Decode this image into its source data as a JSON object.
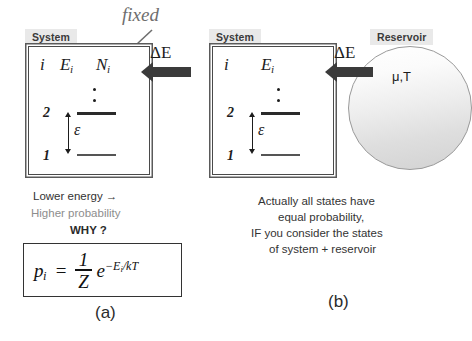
{
  "figure": {
    "width": 472,
    "height": 341,
    "background": "#ffffff"
  },
  "colors": {
    "ink": "#1d1d1d",
    "label_bg": "#e9e9e9",
    "label_text": "#3a3a3a",
    "arrow_fill": "#3b3b3b",
    "dim_text": "#8d8d8d",
    "fixed_text": "#6e6e6e",
    "box_border": "#4a4a4a",
    "reservoir_border": "#9a9a9a"
  },
  "panel_a": {
    "subfigure_label": "(a)",
    "system_label": "System",
    "annotation": {
      "text": "fixed",
      "points_to": "N_i"
    },
    "energy_flow": {
      "label": "ΔE",
      "direction": "into-system",
      "arrow_icon": "left-block-arrow-icon"
    },
    "columns": {
      "index": "i",
      "energy_base": "E",
      "energy_sub": "i",
      "number_base": "N",
      "number_sub": "i"
    },
    "levels": [
      {
        "name": "2",
        "kind": "thick"
      },
      {
        "name": "1",
        "kind": "thin"
      }
    ],
    "ellipsis_dots": 2,
    "gap_symbol": "ε",
    "caption_lines": [
      {
        "text": "Lower energy →",
        "style": "normal"
      },
      {
        "text": "Higher probability",
        "style": "dim"
      },
      {
        "text": "WHY ?",
        "style": "bold"
      }
    ],
    "formula": {
      "lhs_base": "p",
      "lhs_sub": "i",
      "equals": "=",
      "fraction_numerator": "1",
      "fraction_denominator": "Z",
      "exponential_base": "e",
      "exponent": "−E",
      "exponent_sub": "i",
      "exponent_tail": "/kT",
      "plain_text": "p_i = (1/Z) e^(-E_i/kT)"
    }
  },
  "panel_b": {
    "subfigure_label": "(b)",
    "system_label": "System",
    "reservoir_label": "Reservoir",
    "reservoir_variables": "μ,T",
    "energy_flow": {
      "label": "ΔE",
      "direction": "reservoir-to-system",
      "arrow_icon": "left-block-arrow-icon"
    },
    "columns": {
      "index": "i",
      "energy_base": "E",
      "energy_sub": "i"
    },
    "levels": [
      {
        "name": "2",
        "kind": "thick"
      },
      {
        "name": "1",
        "kind": "thin"
      }
    ],
    "ellipsis_dots": 2,
    "gap_symbol": "ε",
    "caption_lines": [
      {
        "text": "Actually all states have",
        "style": "normal"
      },
      {
        "text": "equal probability,",
        "style": "normal"
      },
      {
        "text": "IF you consider the states",
        "style": "normal"
      },
      {
        "text": "of system + reservoir",
        "style": "normal"
      }
    ]
  }
}
